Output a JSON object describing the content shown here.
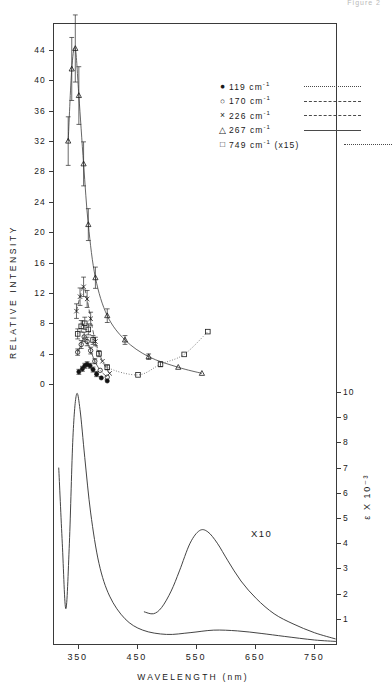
{
  "header": {
    "caption": "Figure 2"
  },
  "axes": {
    "y_left": {
      "title": "RELATIVE INTENSITY",
      "ticks": [
        "0",
        "4",
        "8",
        "12",
        "16",
        "20",
        "24",
        "28",
        "32",
        "36",
        "40",
        "44"
      ],
      "min": 0,
      "max": 44
    },
    "y_right": {
      "title": "ε X 10⁻³",
      "ticks": [
        "1",
        "2",
        "3",
        "4",
        "5",
        "6",
        "7",
        "8",
        "9",
        "10"
      ],
      "min": 0,
      "max": 10
    },
    "x": {
      "title": "WAVELENGTH (nm)",
      "ticks": [
        "350",
        "450",
        "550",
        "650",
        "750"
      ],
      "min": 310,
      "max": 790
    }
  },
  "legend": {
    "items": [
      {
        "symbol": "●",
        "label": "119 cm",
        "exponent": "-1",
        "suffix": "",
        "linestyle": "dotted"
      },
      {
        "symbol": "○",
        "label": "170 cm",
        "exponent": "-1",
        "suffix": "",
        "linestyle": "dashdot"
      },
      {
        "symbol": "×",
        "label": "226 cm",
        "exponent": "-1",
        "suffix": "",
        "linestyle": "dashed"
      },
      {
        "symbol": "△",
        "label": "267 cm",
        "exponent": "-1",
        "suffix": "",
        "linestyle": "solid"
      },
      {
        "symbol": "□",
        "label": "749 cm",
        "exponent": "-1",
        "suffix": "(x15)",
        "linestyle": "fine"
      }
    ]
  },
  "annotations": {
    "x10": "X10"
  },
  "chart_data": {
    "type": "line",
    "xlabel": "WAVELENGTH (nm)",
    "ylabel": "RELATIVE INTENSITY",
    "ylabel_right": "ε X 10⁻³",
    "xlim": [
      310,
      790
    ],
    "ylim": [
      0,
      44
    ],
    "ylim_right": [
      0,
      10
    ],
    "grid": false,
    "legend_position": "top-right",
    "panels": [
      {
        "name": "excitation-profiles",
        "series": [
          {
            "name": "119 cm-1",
            "marker": "filled-circle",
            "linestyle": "dotted",
            "x": [
              352,
              358,
              362,
              366,
              371,
              376,
              382,
              390,
              400
            ],
            "y": [
              1.6,
              2.0,
              2.4,
              2.6,
              2.4,
              1.9,
              1.3,
              0.8,
              0.4
            ]
          },
          {
            "name": "170 cm-1",
            "marker": "open-circle",
            "linestyle": "dashdot",
            "x": [
              350,
              356,
              361,
              366,
              372,
              379,
              388,
              400
            ],
            "y": [
              4.2,
              5.2,
              6.2,
              5.6,
              4.4,
              3.0,
              1.8,
              0.9
            ]
          },
          {
            "name": "226 cm-1",
            "marker": "cross",
            "linestyle": "dashed",
            "x": [
              348,
              354,
              360,
              366,
              372,
              380,
              392,
              404
            ],
            "y": [
              9.6,
              11.5,
              12.8,
              11.2,
              8.6,
              5.6,
              3.0,
              1.4
            ]
          },
          {
            "name": "267 cm-1",
            "marker": "open-triangle",
            "linestyle": "solid",
            "x": [
              334,
              340,
              346,
              352,
              360,
              368,
              380,
              400,
              430,
              470,
              520,
              560
            ],
            "y": [
              32.0,
              41.5,
              44.2,
              38.0,
              29.0,
              21.0,
              14.0,
              9.0,
              5.8,
              3.6,
              2.2,
              1.4
            ]
          },
          {
            "name": "749 cm-1 (x15)",
            "marker": "open-square",
            "linestyle": "fine",
            "x": [
              350,
              356,
              362,
              368,
              376,
              386,
              400,
              452,
              490,
              530,
              570
            ],
            "y": [
              6.6,
              7.6,
              8.0,
              7.2,
              5.8,
              4.0,
              2.2,
              1.2,
              2.6,
              3.9,
              6.9
            ]
          }
        ],
        "error_bars": true
      },
      {
        "name": "absorption-spectrum",
        "series": [
          {
            "name": "absorbance",
            "marker": "none",
            "linestyle": "solid",
            "x": [
              318,
              324,
              330,
              336,
              342,
              348,
              354,
              362,
              372,
              386,
              404,
              430,
              460,
              500,
              540,
              580,
              620,
              660,
              700,
              750,
              788
            ],
            "y": [
              7.0,
              4.0,
              1.4,
              4.0,
              8.2,
              9.9,
              9.3,
              7.4,
              5.2,
              3.2,
              1.9,
              1.0,
              0.55,
              0.38,
              0.45,
              0.55,
              0.52,
              0.42,
              0.3,
              0.16,
              0.1
            ]
          },
          {
            "name": "absorbance x10 (Q band)",
            "marker": "none",
            "linestyle": "solid",
            "x": [
              462,
              478,
              492,
              508,
              522,
              540,
              556,
              570,
              586,
              604,
              626,
              652,
              682,
              714,
              750,
              786
            ],
            "y": [
              1.28,
              1.2,
              1.45,
              2.1,
              2.9,
              4.0,
              4.5,
              4.45,
              4.0,
              3.3,
              2.5,
              1.8,
              1.2,
              0.8,
              0.45,
              0.2
            ]
          }
        ]
      }
    ]
  }
}
